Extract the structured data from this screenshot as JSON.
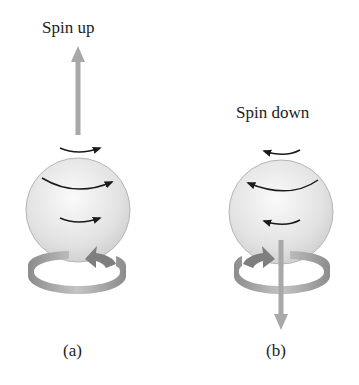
{
  "figure": {
    "panels": [
      {
        "id": "a",
        "title": "Spin up",
        "caption": "(a)",
        "spin_direction": "up",
        "rotation": "counterclockwise-viewed-from-above"
      },
      {
        "id": "b",
        "title": "Spin down",
        "caption": "(b)",
        "spin_direction": "down",
        "rotation": "clockwise-viewed-from-above"
      }
    ],
    "colors": {
      "sphere_fill": "#e6e6e6",
      "sphere_edge": "#b5b5b5",
      "spin_arrow": "#a8a8a8",
      "ring": "#9a9a9a",
      "curved_arrow": "#1a1a1a"
    }
  }
}
